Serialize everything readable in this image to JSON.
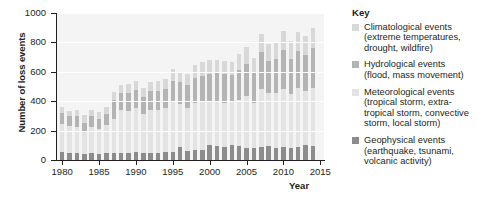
{
  "chart_data": {
    "type": "bar",
    "subtype": "stacked-bar",
    "title": "",
    "xlabel": "Year",
    "ylabel": "Number of loss events",
    "ylim": [
      0,
      1000
    ],
    "ytick_values": [
      0,
      200,
      400,
      600,
      800,
      1000
    ],
    "ytick_labels": [
      "0",
      "200",
      "400",
      "600",
      "800",
      "1000"
    ],
    "xlim": [
      1979.3,
      2015.5
    ],
    "xtick_values": [
      1980,
      1985,
      1990,
      1995,
      2000,
      2005,
      2010,
      2015
    ],
    "xtick_labels": [
      "1980",
      "1985",
      "1990",
      "1995",
      "2000",
      "2005",
      "2010",
      "2015"
    ],
    "grid": "horizontal-white-on-grey",
    "legend_position": "right",
    "plot_background": "#f4f4f4",
    "categories": [
      1980,
      1981,
      1982,
      1983,
      1984,
      1985,
      1986,
      1987,
      1988,
      1989,
      1990,
      1991,
      1992,
      1993,
      1994,
      1995,
      1996,
      1997,
      1998,
      1999,
      2000,
      2001,
      2002,
      2003,
      2004,
      2005,
      2006,
      2007,
      2008,
      2009,
      2010,
      2011,
      2012,
      2013,
      2014
    ],
    "series": [
      {
        "name": "Geophysical events",
        "color": "#8c8c8c",
        "stack_order": 1,
        "values": [
          52,
          45,
          46,
          42,
          48,
          44,
          50,
          46,
          48,
          50,
          52,
          48,
          50,
          50,
          52,
          56,
          86,
          62,
          66,
          70,
          104,
          96,
          88,
          104,
          92,
          82,
          80,
          90,
          92,
          82,
          86,
          80,
          88,
          104,
          94
        ]
      },
      {
        "name": "Meteorological events",
        "color": "#e3e3e3",
        "stack_order": 2,
        "values": [
          196,
          186,
          182,
          150,
          178,
          168,
          186,
          232,
          292,
          282,
          300,
          268,
          292,
          292,
          300,
          342,
          296,
          290,
          322,
          330,
          298,
          306,
          302,
          300,
          318,
          352,
          310,
          396,
          364,
          372,
          396,
          368,
          400,
          368,
          394
        ]
      },
      {
        "name": "Hydrological events",
        "color": "#b4b4b4",
        "stack_order": 3,
        "values": [
          72,
          66,
          70,
          62,
          72,
          68,
          76,
          128,
          118,
          126,
          122,
          116,
          130,
          130,
          134,
          140,
          146,
          156,
          168,
          172,
          180,
          188,
          192,
          176,
          204,
          222,
          204,
          252,
          220,
          232,
          266,
          236,
          252,
          244,
          276
        ]
      },
      {
        "name": "Climatological events",
        "color": "#d8d8d8",
        "stack_order": 4,
        "values": [
          38,
          36,
          40,
          50,
          40,
          44,
          46,
          60,
          52,
          60,
          64,
          58,
          62,
          64,
          68,
          82,
          72,
          76,
          88,
          92,
          96,
          90,
          94,
          88,
          104,
          110,
          98,
          122,
          116,
          112,
          132,
          126,
          130,
          126,
          136
        ]
      }
    ],
    "totals": [
      358,
      333,
      338,
      304,
      338,
      324,
      358,
      466,
      510,
      518,
      538,
      490,
      534,
      536,
      554,
      620,
      600,
      584,
      644,
      664,
      678,
      680,
      676,
      668,
      718,
      766,
      692,
      860,
      792,
      798,
      880,
      810,
      870,
      842,
      900
    ],
    "annotations": []
  },
  "legend": {
    "title": "Key",
    "items": [
      {
        "name": "Climatological events",
        "description": "(extreme temperatures, drought, wildfire)",
        "color": "#d8d8d8"
      },
      {
        "name": "Hydrological events",
        "description": "(flood, mass movement)",
        "color": "#b4b4b4"
      },
      {
        "name": "Meteorological events",
        "description": "(tropical storm, extra-tropical storm, convective storm, local storm)",
        "color": "#e3e3e3"
      },
      {
        "name": "Geophysical events",
        "description": "(earthquake, tsunami, volcanic activity)",
        "color": "#8c8c8c"
      }
    ]
  }
}
